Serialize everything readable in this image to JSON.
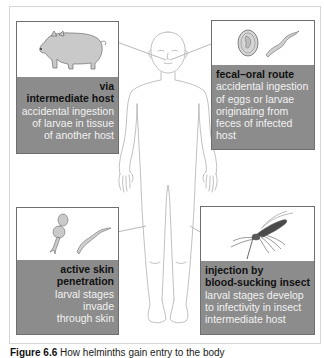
{
  "figure": {
    "caption_label": "Figure 6.6",
    "caption_text": "How helminths gain entry to the body"
  },
  "colors": {
    "band": "#8c8c8c",
    "title_text": "#111111",
    "desc_text": "#f2f2f2",
    "line": "#9a9a9a"
  },
  "routes": [
    {
      "id": "intermediate-host",
      "icon": "pig-icon",
      "title": "via intermediate host",
      "title_lines": [
        "via",
        "intermediate host"
      ],
      "description_lines": [
        "accidental ingestion",
        "of larvae in tissue",
        "of another host"
      ]
    },
    {
      "id": "fecal-oral",
      "icon": "egg-and-larva-icon",
      "title": "fecal–oral route",
      "title_lines": [
        "fecal–oral route"
      ],
      "description_lines": [
        "accidental ingestion",
        "of eggs or larvae",
        "originating from",
        "feces of infected",
        "host"
      ]
    },
    {
      "id": "skin-penetration",
      "icon": "cercaria-and-larva-icon",
      "title": "active skin penetration",
      "title_lines": [
        "active skin",
        "penetration"
      ],
      "description_lines": [
        "larval stages",
        "invade",
        "through skin"
      ]
    },
    {
      "id": "insect-injection",
      "icon": "mosquito-icon",
      "title": "injection by blood-sucking insect",
      "title_lines": [
        "injection by",
        "blood-sucking insect"
      ],
      "description_lines": [
        "larval stages develop",
        "to infectivity in insect",
        "intermediate host"
      ]
    }
  ]
}
